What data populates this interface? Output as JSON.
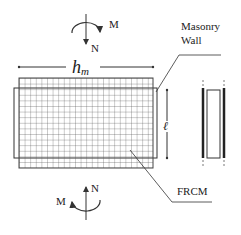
{
  "diagram": {
    "type": "technical-schematic",
    "labels": {
      "masonry_wall_line1": "Masonry",
      "masonry_wall_line2": "Wall",
      "frcm": "FRCM",
      "width_symbol": "h",
      "width_subscript": "m",
      "length_symbol": "ℓ",
      "top_moment": "M",
      "top_axial": "N",
      "bottom_moment": "M",
      "bottom_axial": "N"
    },
    "colors": {
      "line": "#333333",
      "grid": "#555555",
      "text": "#222222",
      "background": "#ffffff"
    }
  }
}
